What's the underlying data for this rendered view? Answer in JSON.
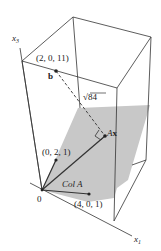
{
  "figure": {
    "axes": {
      "x3_label": "x",
      "x3_sub": "3",
      "x1_label": "x",
      "x1_sub": "1"
    },
    "points": {
      "b_coords": "(2, 0, 11)",
      "b_label": "b",
      "v2_coords": "(0, 2, 1)",
      "v1_coords": "(4, 0, 1)",
      "origin_label": "0",
      "ax_label": "Ax"
    },
    "plane_label": "Col A",
    "distance_label": "84",
    "distance_radical": "√",
    "colors": {
      "plane": "#c8c8c8",
      "lines": "#333333"
    }
  }
}
